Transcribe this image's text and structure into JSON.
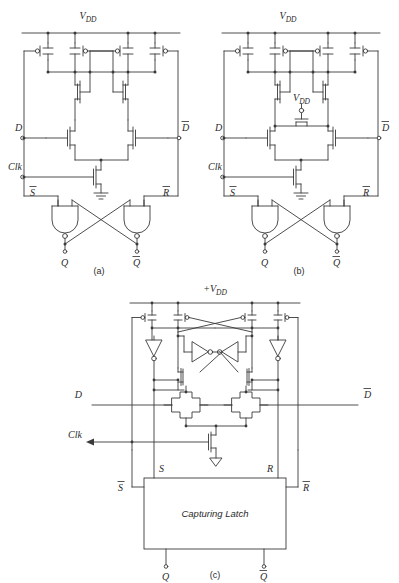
{
  "figure": {
    "background": "#ffffff",
    "line_color": "#3a3a3a",
    "text_color": "#2b2b2b"
  },
  "panels": [
    {
      "id": "a",
      "caption": "(a)",
      "supply_label": "VDD",
      "supply_v": "V",
      "supply_sub": "DD",
      "inputs": [
        {
          "name": "D",
          "label": "D",
          "overbar": false
        },
        {
          "name": "Clk",
          "label": "Clk",
          "overbar": false
        },
        {
          "name": "Dbar",
          "label": "D",
          "overbar": true
        }
      ],
      "internal_nodes": [
        {
          "name": "Sbar",
          "label": "S",
          "overbar": true
        },
        {
          "name": "Rbar",
          "label": "R",
          "overbar": true
        }
      ],
      "outputs": [
        {
          "name": "Q",
          "label": "Q",
          "overbar": false
        },
        {
          "name": "Qbar",
          "label": "Q",
          "overbar": true
        }
      ],
      "gates": [
        "nand-gate-left",
        "nand-gate-right"
      ],
      "ground": true
    },
    {
      "id": "b",
      "caption": "(b)",
      "supply_label": "VDD",
      "supply_v": "V",
      "supply_sub": "DD",
      "mid_supply_v": "V",
      "mid_supply_sub": "DD",
      "inputs": [
        {
          "name": "D",
          "label": "D",
          "overbar": false
        },
        {
          "name": "Clk",
          "label": "Clk",
          "overbar": false
        },
        {
          "name": "Dbar",
          "label": "D",
          "overbar": true
        }
      ],
      "internal_nodes": [
        {
          "name": "Sbar",
          "label": "S",
          "overbar": true
        },
        {
          "name": "Rbar",
          "label": "R",
          "overbar": true
        }
      ],
      "outputs": [
        {
          "name": "Q",
          "label": "Q",
          "overbar": false
        },
        {
          "name": "Qbar",
          "label": "Q",
          "overbar": true
        }
      ],
      "gates": [
        "nand-gate-left",
        "nand-gate-right"
      ],
      "ground": true
    },
    {
      "id": "c",
      "caption": "(c)",
      "supply_label": "+VDD",
      "supply_plus": "+",
      "supply_v": "V",
      "supply_sub": "DD",
      "inputs": [
        {
          "name": "D",
          "label": "D",
          "overbar": false
        },
        {
          "name": "Clk",
          "label": "Clk",
          "overbar": false
        },
        {
          "name": "Dbar",
          "label": "D",
          "overbar": true
        }
      ],
      "internal_nodes": [
        {
          "name": "S",
          "label": "S",
          "overbar": false
        },
        {
          "name": "R",
          "label": "R",
          "overbar": false
        },
        {
          "name": "Sbar",
          "label": "S",
          "overbar": true
        },
        {
          "name": "Rbar",
          "label": "R",
          "overbar": true
        }
      ],
      "block": {
        "name": "capturing-latch",
        "label": "Capturing Latch"
      },
      "outputs": [
        {
          "name": "Q",
          "label": "Q",
          "overbar": false
        },
        {
          "name": "Qbar",
          "label": "Q",
          "overbar": true
        }
      ],
      "ground": true
    }
  ]
}
